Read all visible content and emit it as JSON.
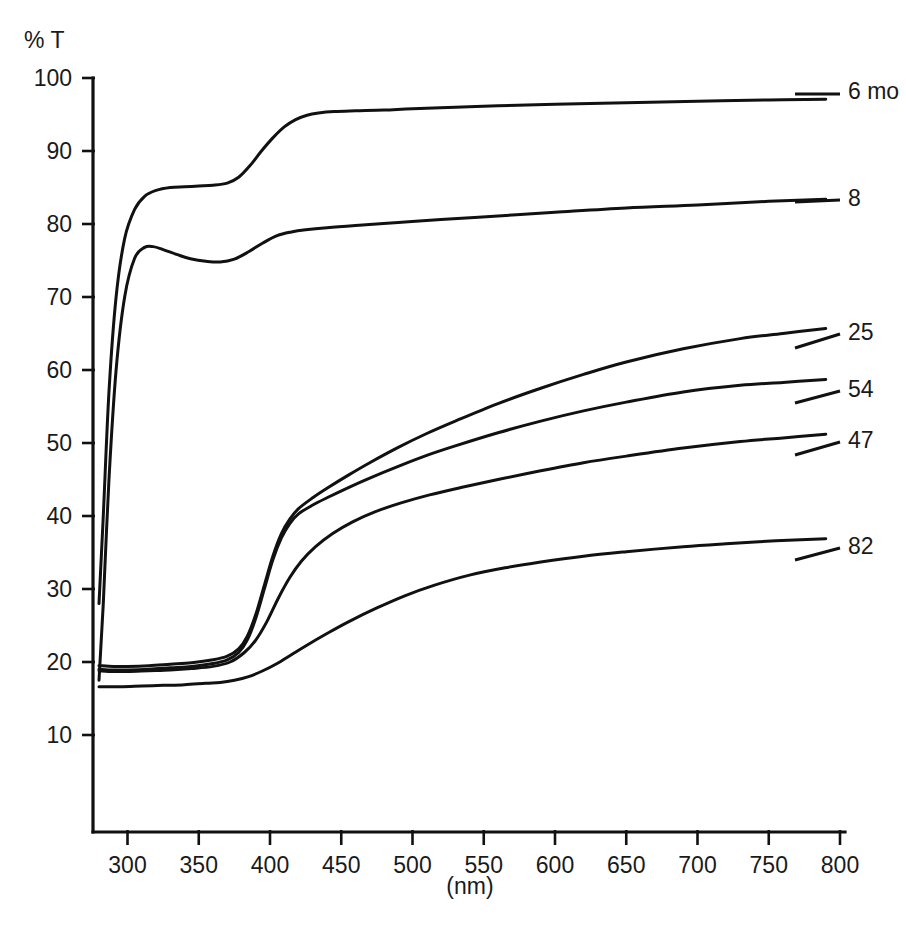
{
  "chart_data": {
    "type": "line",
    "title": "",
    "xlabel": "(nm)",
    "ylabel": "% T",
    "xlim": [
      275,
      800
    ],
    "ylim": [
      0,
      100
    ],
    "xticks": [
      300,
      350,
      400,
      450,
      500,
      550,
      600,
      650,
      700,
      750,
      800
    ],
    "yticks": [
      10,
      20,
      30,
      40,
      50,
      60,
      70,
      80,
      90,
      100
    ],
    "grid": false,
    "legend_position": "right-inline-labels",
    "x_tick_labels": [
      "300",
      "350",
      "400",
      "450",
      "500",
      "550",
      "600",
      "650",
      "700",
      "750",
      "800"
    ],
    "y_tick_labels": [
      "10",
      "20",
      "30",
      "40",
      "50",
      "60",
      "70",
      "80",
      "90",
      "100"
    ],
    "series": [
      {
        "name": "6 mo",
        "label": "6 mo",
        "x": [
          280,
          283,
          287,
          292,
          298,
          305,
          312,
          320,
          330,
          340,
          350,
          360,
          370,
          378,
          386,
          394,
          402,
          410,
          418,
          426,
          434,
          445,
          460,
          480,
          500,
          530,
          560,
          600,
          650,
          700,
          750,
          790
        ],
        "y": [
          28.0,
          40.0,
          57.0,
          70.0,
          78.0,
          82.0,
          83.8,
          84.6,
          85.0,
          85.1,
          85.2,
          85.3,
          85.6,
          86.4,
          88.0,
          90.0,
          91.8,
          93.3,
          94.3,
          94.9,
          95.2,
          95.4,
          95.5,
          95.6,
          95.8,
          96.0,
          96.2,
          96.4,
          96.6,
          96.8,
          97.0,
          97.1
        ]
      },
      {
        "name": "8",
        "label": "8",
        "x": [
          280,
          283,
          287,
          292,
          298,
          305,
          312,
          318,
          325,
          335,
          345,
          355,
          365,
          375,
          385,
          395,
          405,
          415,
          425,
          440,
          460,
          490,
          520,
          560,
          600,
          650,
          700,
          750,
          790
        ],
        "y": [
          17.5,
          28.0,
          45.0,
          60.0,
          70.0,
          75.3,
          76.8,
          76.9,
          76.5,
          75.8,
          75.2,
          74.9,
          74.8,
          75.2,
          76.2,
          77.4,
          78.4,
          78.9,
          79.2,
          79.5,
          79.8,
          80.2,
          80.6,
          81.1,
          81.6,
          82.2,
          82.6,
          83.1,
          83.4
        ]
      },
      {
        "name": "25",
        "label": "25",
        "x": [
          280,
          290,
          300,
          315,
          330,
          345,
          360,
          370,
          378,
          384,
          390,
          396,
          402,
          408,
          414,
          420,
          430,
          440,
          455,
          470,
          490,
          510,
          530,
          560,
          590,
          620,
          650,
          690,
          730,
          760,
          790
        ],
        "y": [
          19.5,
          19.4,
          19.4,
          19.5,
          19.7,
          19.9,
          20.3,
          20.8,
          21.8,
          23.5,
          26.5,
          30.5,
          34.5,
          37.6,
          39.6,
          41.0,
          42.5,
          43.8,
          45.6,
          47.3,
          49.4,
          51.3,
          53.0,
          55.4,
          57.5,
          59.4,
          61.1,
          62.9,
          64.3,
          65.0,
          65.7
        ]
      },
      {
        "name": "54",
        "label": "54",
        "x": [
          280,
          290,
          300,
          315,
          330,
          345,
          360,
          370,
          378,
          384,
          390,
          396,
          402,
          408,
          414,
          420,
          430,
          440,
          455,
          470,
          490,
          510,
          530,
          560,
          590,
          620,
          650,
          690,
          730,
          760,
          790
        ],
        "y": [
          19.0,
          18.9,
          18.9,
          19.0,
          19.2,
          19.4,
          19.8,
          20.3,
          21.3,
          23.0,
          26.0,
          30.0,
          34.0,
          37.0,
          39.0,
          40.3,
          41.5,
          42.5,
          43.9,
          45.2,
          46.8,
          48.3,
          49.6,
          51.4,
          53.0,
          54.4,
          55.6,
          57.0,
          57.9,
          58.3,
          58.7
        ]
      },
      {
        "name": "47",
        "label": "47",
        "x": [
          280,
          290,
          300,
          315,
          330,
          345,
          360,
          372,
          382,
          390,
          398,
          406,
          414,
          422,
          432,
          444,
          458,
          474,
          492,
          512,
          534,
          560,
          590,
          620,
          650,
          690,
          730,
          760,
          790
        ],
        "y": [
          18.8,
          18.7,
          18.7,
          18.8,
          18.9,
          19.1,
          19.4,
          20.0,
          21.3,
          23.0,
          25.6,
          28.8,
          31.6,
          33.8,
          35.8,
          37.6,
          39.2,
          40.6,
          41.8,
          42.9,
          43.9,
          45.0,
          46.2,
          47.3,
          48.2,
          49.3,
          50.2,
          50.7,
          51.2
        ]
      },
      {
        "name": "82",
        "label": "82",
        "x": [
          280,
          295,
          310,
          325,
          340,
          355,
          365,
          375,
          385,
          395,
          405,
          415,
          425,
          440,
          455,
          475,
          495,
          515,
          540,
          565,
          590,
          620,
          650,
          690,
          720,
          755,
          790
        ],
        "y": [
          16.6,
          16.6,
          16.7,
          16.8,
          16.9,
          17.1,
          17.2,
          17.5,
          18.0,
          18.8,
          19.8,
          21.0,
          22.2,
          23.9,
          25.5,
          27.4,
          29.1,
          30.5,
          31.9,
          32.9,
          33.7,
          34.5,
          35.1,
          35.8,
          36.2,
          36.6,
          36.9
        ]
      }
    ],
    "series_label_anchors": [
      {
        "name": "6 mo",
        "label_x": 848,
        "label_y": 99,
        "leader_x1": 795,
        "leader_y1": 94,
        "leader_x2": 840,
        "leader_y2": 94
      },
      {
        "name": "8",
        "label_x": 848,
        "label_y": 206,
        "leader_x1": 795,
        "leader_y1": 202,
        "leader_x2": 840,
        "leader_y2": 200
      },
      {
        "name": "25",
        "label_x": 848,
        "label_y": 340,
        "leader_x1": 795,
        "leader_y1": 348,
        "leader_x2": 840,
        "leader_y2": 334
      },
      {
        "name": "54",
        "label_x": 848,
        "label_y": 397,
        "leader_x1": 795,
        "leader_y1": 403,
        "leader_x2": 840,
        "leader_y2": 391
      },
      {
        "name": "47",
        "label_x": 848,
        "label_y": 448,
        "leader_x1": 795,
        "leader_y1": 455,
        "leader_x2": 840,
        "leader_y2": 442
      },
      {
        "name": "82",
        "label_x": 848,
        "label_y": 554,
        "leader_x1": 795,
        "leader_y1": 560,
        "leader_x2": 840,
        "leader_y2": 548
      }
    ]
  },
  "axes": {
    "y_axis_title": "% T",
    "x_axis_title": "(nm)"
  }
}
